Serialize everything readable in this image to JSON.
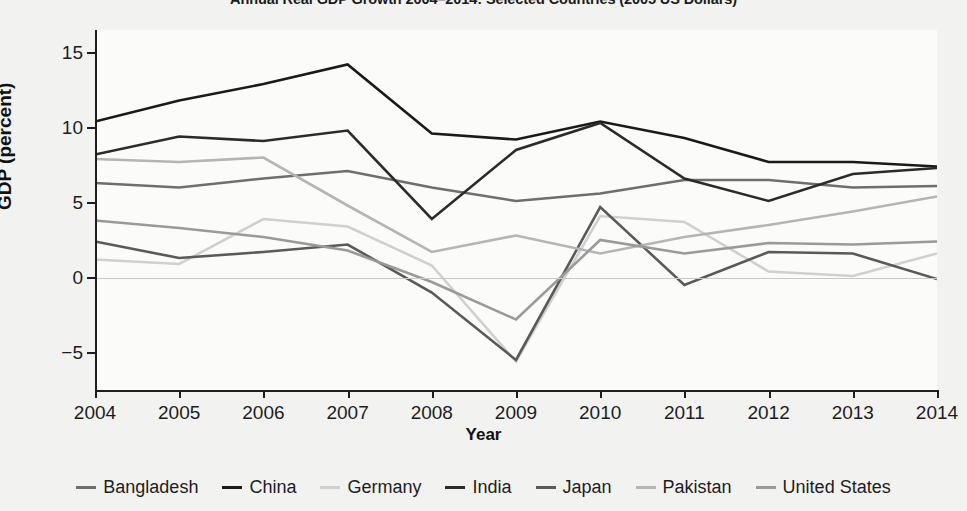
{
  "chart_data": {
    "type": "line",
    "title": "Annual Real GDP Growth 2004–2014: Selected Countries (2005 US Dollars)",
    "xlabel": "Year",
    "ylabel": "GDP (percent)",
    "categories": [
      "2004",
      "2005",
      "2006",
      "2007",
      "2008",
      "2009",
      "2010",
      "2011",
      "2012",
      "2013",
      "2014"
    ],
    "x": [
      2004,
      2005,
      2006,
      2007,
      2008,
      2009,
      2010,
      2011,
      2012,
      2013,
      2014
    ],
    "ylim": [
      -7.5,
      16.5
    ],
    "xlim": [
      2004,
      2014
    ],
    "yticks": [
      15,
      10,
      5,
      0,
      -5
    ],
    "ytick_labels": [
      "15",
      "10",
      "5",
      "0",
      "−5"
    ],
    "grid": false,
    "zero_line": true,
    "legend_position": "bottom",
    "series": [
      {
        "name": "Bangladesh",
        "color": "#6e6e6e",
        "values": [
          6.3,
          6.0,
          6.6,
          7.1,
          6.0,
          5.1,
          5.6,
          6.5,
          6.5,
          6.0,
          6.1
        ]
      },
      {
        "name": "China",
        "color": "#1a1a1a",
        "values": [
          10.4,
          11.8,
          12.9,
          14.2,
          9.6,
          9.2,
          10.4,
          9.3,
          7.7,
          7.7,
          7.4
        ]
      },
      {
        "name": "Germany",
        "color": "#d0d0d0",
        "values": [
          1.2,
          0.9,
          3.9,
          3.4,
          0.8,
          -5.6,
          4.1,
          3.7,
          0.4,
          0.1,
          1.6
        ]
      },
      {
        "name": "India",
        "color": "#2b2b2b",
        "values": [
          8.2,
          9.4,
          9.1,
          9.8,
          3.9,
          8.5,
          10.3,
          6.6,
          5.1,
          6.9,
          7.3
        ]
      },
      {
        "name": "Japan",
        "color": "#5a5a5a",
        "values": [
          2.4,
          1.3,
          1.7,
          2.2,
          -1.0,
          -5.5,
          4.7,
          -0.5,
          1.7,
          1.6,
          -0.1
        ]
      },
      {
        "name": "Pakistan",
        "color": "#b5b5b5",
        "values": [
          7.9,
          7.7,
          8.0,
          4.8,
          1.7,
          2.8,
          1.6,
          2.7,
          3.5,
          4.4,
          5.4
        ]
      },
      {
        "name": "United States",
        "color": "#9a9a9a",
        "values": [
          3.8,
          3.3,
          2.7,
          1.8,
          -0.3,
          -2.8,
          2.5,
          1.6,
          2.3,
          2.2,
          2.4
        ]
      }
    ]
  }
}
